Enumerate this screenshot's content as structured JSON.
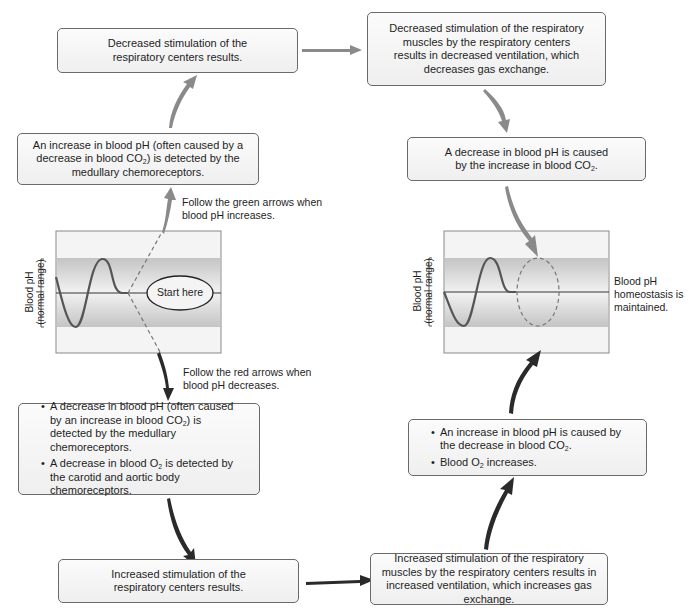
{
  "diagram": {
    "colors": {
      "increase_arrow": "#8a8a8a",
      "decrease_arrow": "#2a2a2a",
      "band": "#c8c8c8",
      "box_border": "#6a6a6a"
    },
    "boxes": {
      "top_left": {
        "text": "Decreased stimulation of the respiratory centers results."
      },
      "top_right": {
        "text": "Decreased stimulation of the respiratory muscles by the respiratory centers results in decreased ventilation, which decreases gas exchange."
      },
      "left_increase": {
        "line1": "An increase in blood pH (often caused by a",
        "line2_pre": "decrease in blood CO",
        "line2_sub": "2",
        "line2_post": ") is detected by the",
        "line3": "medullary chemoreceptors."
      },
      "right_decrease": {
        "line1": "A decrease in blood pH is caused",
        "line2_pre": "by the increase in blood CO",
        "line2_sub": "2",
        "line2_post": "."
      },
      "left_decrease": {
        "bullets": [
          {
            "pre": "A decrease in blood pH (often caused by an increase in blood CO",
            "sub": "2",
            "post": ") is detected by the medullary chemoreceptors."
          },
          {
            "pre": "A decrease in blood O",
            "sub": "2",
            "post": " is detected by the carotid and aortic body chemoreceptors."
          }
        ]
      },
      "right_increase": {
        "bullets": [
          {
            "pre": "An increase in blood pH is caused by the decrease in blood CO",
            "sub": "2",
            "post": "."
          },
          {
            "pre": "Blood O",
            "sub": "2",
            "post": " increases."
          }
        ]
      },
      "bottom_left": {
        "text": "Increased stimulation of the respiratory centers results."
      },
      "bottom_right": {
        "text": "Increased stimulation of the respiratory muscles by the respiratory centers results in increased ventilation, which increases gas exchange."
      }
    },
    "notes": {
      "green": "Follow the green arrows when blood pH increases.",
      "red": "Follow the red arrows when blood pH decreases.",
      "homeostasis": "Blood pH homeostasis is maintained."
    },
    "graphs": {
      "left": {
        "ylabel_line1": "Blood pH",
        "ylabel_line2": "(normal range)",
        "start_label": "Start here"
      },
      "right": {
        "ylabel_line1": "Blood pH",
        "ylabel_line2": "(normal range)"
      }
    }
  }
}
